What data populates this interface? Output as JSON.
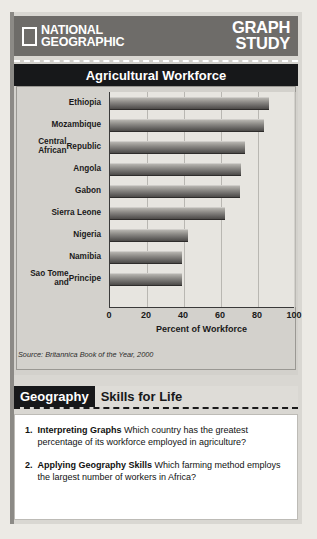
{
  "header": {
    "brand_line1": "NATIONAL",
    "brand_line2": "GEOGRAPHIC",
    "feature_line1": "GRAPH",
    "feature_line2": "STUDY",
    "logo_icon": "national-geographic-rectangle-icon",
    "bar_color": "#6e6c69"
  },
  "chart_data": {
    "type": "bar",
    "orientation": "horizontal",
    "title": "Agricultural Workforce",
    "categories": [
      "Ethiopia",
      "Mozambique",
      "Central African Republic",
      "Angola",
      "Gabon",
      "Sierra Leone",
      "Nigeria",
      "Namibia",
      "Sao Tome and Principe"
    ],
    "category_lines": [
      [
        "Ethiopia"
      ],
      [
        "Mozambique"
      ],
      [
        "Central African",
        "Republic"
      ],
      [
        "Angola"
      ],
      [
        "Gabon"
      ],
      [
        "Sierra Leone"
      ],
      [
        "Nigeria"
      ],
      [
        "Namibia"
      ],
      [
        "Sao Tome and",
        "Principe"
      ]
    ],
    "values": [
      86,
      83,
      73,
      71,
      70,
      62,
      42,
      39,
      39
    ],
    "xlabel": "Percent of Workforce",
    "ylabel": "",
    "xlim": [
      0,
      100
    ],
    "xticks": [
      0,
      20,
      40,
      60,
      80,
      100
    ],
    "grid": true,
    "legend": "none",
    "source": "Source: Britannica Book of the Year, 2000",
    "bar_color": "#8f8d89"
  },
  "banner": {
    "geography_label": "Geography",
    "skills_label": "Skills for Life"
  },
  "questions": [
    {
      "number": "1.",
      "bold": "Interpreting Graphs",
      "text": " Which country has the greatest percentage of its workforce employed in agriculture?"
    },
    {
      "number": "2.",
      "bold": "Applying Geography Skills",
      "text": " Which farming method employs the largest number of workers in Africa?"
    }
  ]
}
